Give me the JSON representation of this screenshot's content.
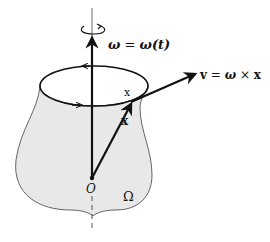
{
  "diagram": {
    "omega_label_sym": "ω",
    "omega_label_eq": " = ",
    "omega_label_rhs": "ω(t)",
    "velocity_label_v": "v",
    "velocity_label_eq": " = ",
    "velocity_label_omega": "ω",
    "velocity_label_times": " × ",
    "velocity_label_x": "x",
    "point_label": "x",
    "position_label": "x",
    "origin_label": "O",
    "region_label": "Ω",
    "colors": {
      "region_fill": "#e8e8e8",
      "stroke": "#111111"
    }
  }
}
